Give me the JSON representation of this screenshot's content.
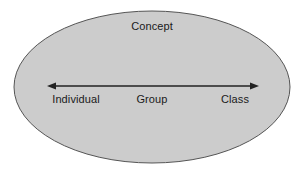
{
  "diagram": {
    "type": "ellipse-with-bidirectional-axis",
    "background_color": "#ffffff",
    "ellipse": {
      "name": "concept-ellipse",
      "fill_color": "#cccccc",
      "stroke_color": "#555555",
      "stroke_width": 1,
      "center_x": 152,
      "center_y": 87,
      "radius_x": 138,
      "radius_y": 76
    },
    "title_label": "Concept",
    "axis": {
      "name": "individual-class-axis",
      "color": "#222222",
      "line_width": 1.2,
      "start_x": 48,
      "end_x": 258,
      "y": 86,
      "arrowhead_left": true,
      "arrowhead_right": true
    },
    "axis_labels": [
      {
        "id": "individual",
        "text": "Individual",
        "position": "left"
      },
      {
        "id": "group",
        "text": "Group",
        "position": "center"
      },
      {
        "id": "class",
        "text": "Class",
        "position": "right"
      }
    ]
  }
}
